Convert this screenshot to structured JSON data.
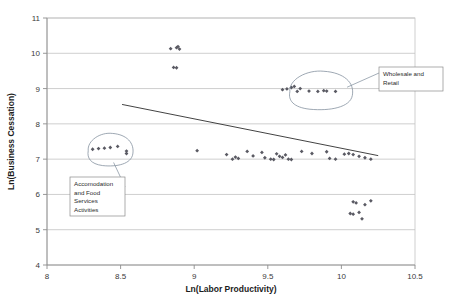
{
  "chart_data": {
    "type": "scatter",
    "title": "",
    "xlabel": "Ln(Labor Productivity)",
    "ylabel": "Ln(Business Cessation)",
    "xlim": [
      8,
      10.5
    ],
    "ylim": [
      4,
      11
    ],
    "xticks": [
      "8",
      "8.5",
      "9",
      "9.5",
      "10",
      "10.5"
    ],
    "xtick_values": [
      8,
      8.5,
      9,
      9.5,
      10,
      10.5
    ],
    "yticks": [
      "11",
      "10",
      "9",
      "8",
      "7",
      "6",
      "5",
      "4"
    ],
    "ytick_values": [
      11,
      10,
      9,
      8,
      7,
      6,
      5,
      4
    ],
    "grid": "horizontal",
    "legend": "none",
    "series": [
      {
        "name": "Industry observations",
        "marker": "diamond",
        "color": "#5a5a63",
        "points": [
          [
            8.31,
            7.28
          ],
          [
            8.35,
            7.3
          ],
          [
            8.39,
            7.31
          ],
          [
            8.43,
            7.33
          ],
          [
            8.48,
            7.36
          ],
          [
            8.54,
            7.23
          ],
          [
            8.54,
            7.16
          ],
          [
            8.84,
            10.13
          ],
          [
            8.88,
            10.16
          ],
          [
            8.9,
            10.12
          ],
          [
            8.89,
            10.19
          ],
          [
            8.86,
            9.6
          ],
          [
            8.88,
            9.59
          ],
          [
            9.02,
            7.24
          ],
          [
            9.22,
            7.13
          ],
          [
            9.26,
            7.0
          ],
          [
            9.28,
            7.06
          ],
          [
            9.3,
            7.02
          ],
          [
            9.36,
            7.22
          ],
          [
            9.4,
            7.09
          ],
          [
            9.46,
            7.19
          ],
          [
            9.48,
            7.04
          ],
          [
            9.52,
            7.0
          ],
          [
            9.54,
            6.99
          ],
          [
            9.56,
            7.15
          ],
          [
            9.58,
            7.08
          ],
          [
            9.6,
            7.05
          ],
          [
            9.62,
            7.12
          ],
          [
            9.64,
            7.0
          ],
          [
            9.66,
            6.99
          ],
          [
            9.6,
            8.97
          ],
          [
            9.63,
            8.99
          ],
          [
            9.66,
            9.03
          ],
          [
            9.68,
            9.06
          ],
          [
            9.7,
            8.92
          ],
          [
            9.72,
            9.0
          ],
          [
            9.78,
            8.93
          ],
          [
            9.84,
            8.92
          ],
          [
            9.88,
            8.94
          ],
          [
            9.9,
            8.93
          ],
          [
            9.96,
            8.92
          ],
          [
            9.73,
            7.22
          ],
          [
            9.8,
            7.16
          ],
          [
            9.9,
            7.21
          ],
          [
            9.92,
            7.02
          ],
          [
            9.96,
            7.0
          ],
          [
            10.02,
            7.14
          ],
          [
            10.05,
            7.16
          ],
          [
            10.08,
            7.13
          ],
          [
            10.12,
            7.08
          ],
          [
            10.16,
            7.04
          ],
          [
            10.2,
            7.0
          ],
          [
            10.08,
            5.79
          ],
          [
            10.1,
            5.76
          ],
          [
            10.12,
            5.49
          ],
          [
            10.16,
            5.71
          ],
          [
            10.2,
            5.82
          ],
          [
            10.14,
            5.31
          ],
          [
            10.06,
            5.46
          ],
          [
            10.08,
            5.44
          ]
        ]
      }
    ],
    "trendline": {
      "label": "",
      "x0": 8.51,
      "y0": 8.55,
      "x1": 10.25,
      "y1": 7.1,
      "color": "#2e2e2e"
    },
    "annotations": [
      {
        "name": "wholesale-and-retail",
        "lines": [
          "Wholesale and",
          "Retail"
        ],
        "box": {
          "x": 379,
          "y": 67,
          "w": 64,
          "h": 24
        },
        "lasso": {
          "cx": 9.86,
          "cy": 8.96,
          "rx": 0.21,
          "ry": 0.52
        }
      },
      {
        "name": "accomodation-and-food-services-activities",
        "lines": [
          "Accomodation",
          "and Food",
          "Services",
          "Activities"
        ],
        "box": {
          "x": 70,
          "y": 177,
          "w": 55,
          "h": 39
        },
        "lasso": {
          "cx": 8.43,
          "cy": 7.28,
          "rx": 0.15,
          "ry": 0.44
        }
      }
    ]
  }
}
